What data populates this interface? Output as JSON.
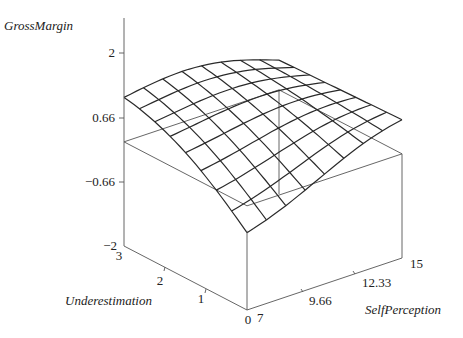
{
  "chart_data": {
    "type": "surface",
    "title": "",
    "zlabel": "GrossMargin",
    "xlabel": "Underestimation",
    "ylabel": "SelfPerception",
    "z_ticks": [
      "2",
      "0.66",
      "−0.66",
      "−2"
    ],
    "z_tick_values": [
      2,
      0.66,
      -0.66,
      -2
    ],
    "x_ticks": [
      "3",
      "2",
      "1",
      "0"
    ],
    "x_tick_values": [
      3,
      2,
      1,
      0
    ],
    "y_ticks": [
      "7",
      "9.66",
      "12.33",
      "15"
    ],
    "y_tick_values": [
      7,
      9.66,
      12.33,
      15
    ],
    "zlim": [
      -2,
      2
    ],
    "xlim": [
      0,
      3
    ],
    "ylim": [
      7,
      15
    ],
    "grid": false,
    "mesh_resolution": [
      9,
      9
    ],
    "surface_samples": {
      "Underestimation": [
        0,
        0.375,
        0.75,
        1.125,
        1.5,
        1.875,
        2.25,
        2.625,
        3
      ],
      "SelfPerception": [
        7,
        8,
        9,
        10,
        11,
        12,
        13,
        14,
        15
      ],
      "corner_values": {
        "U0_S7": -0.35,
        "U3_S7": 1.06,
        "U0_S15": 0.7,
        "U3_S15": 0.55
      }
    },
    "colors": {
      "mesh": "#2a2a2a",
      "frame": "#555555",
      "background": "#ffffff"
    }
  }
}
